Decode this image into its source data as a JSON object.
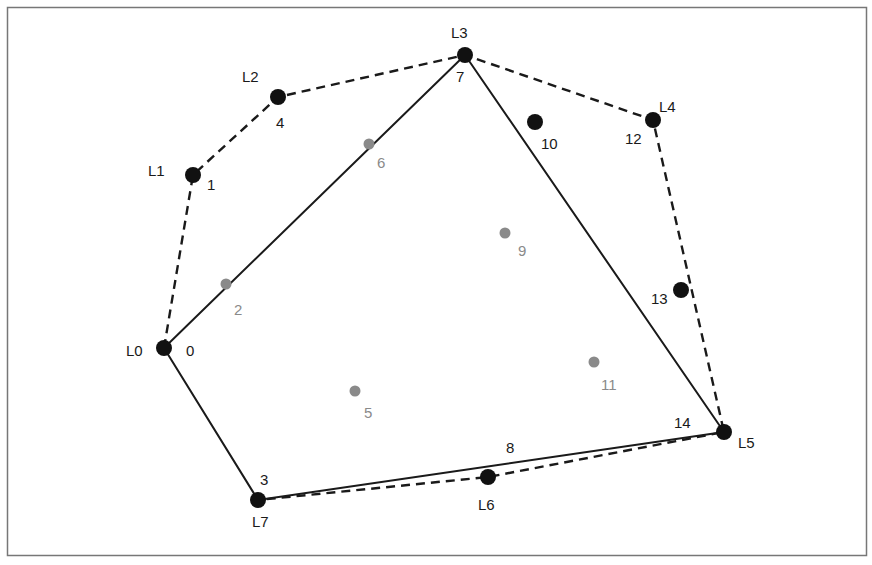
{
  "diagram": {
    "points": [
      {
        "id": "0",
        "x": 164,
        "y": 348,
        "style": "black",
        "hull_label": "L0",
        "id_pos": [
          186,
          356
        ],
        "hull_pos": [
          126,
          356
        ]
      },
      {
        "id": "1",
        "x": 193,
        "y": 175,
        "style": "black",
        "hull_label": "L1",
        "id_pos": [
          207,
          190
        ],
        "hull_pos": [
          148,
          176
        ]
      },
      {
        "id": "2",
        "x": 226,
        "y": 284,
        "style": "gray",
        "id_pos": [
          234,
          315
        ]
      },
      {
        "id": "3",
        "x": 258,
        "y": 500,
        "style": "black",
        "hull_label": "L7",
        "id_pos": [
          260,
          485
        ],
        "hull_pos": [
          252,
          527
        ]
      },
      {
        "id": "4",
        "x": 278,
        "y": 97,
        "style": "black",
        "hull_label": "L2",
        "id_pos": [
          276,
          128
        ],
        "hull_pos": [
          242,
          82
        ]
      },
      {
        "id": "5",
        "x": 355,
        "y": 391,
        "style": "gray",
        "id_pos": [
          364,
          418
        ]
      },
      {
        "id": "6",
        "x": 369,
        "y": 144,
        "style": "gray",
        "id_pos": [
          377,
          168
        ]
      },
      {
        "id": "7",
        "x": 465,
        "y": 55,
        "style": "black",
        "hull_label": "L3",
        "id_pos": [
          456,
          82
        ],
        "hull_pos": [
          451,
          38
        ]
      },
      {
        "id": "8",
        "x": 511,
        "y": 447,
        "style": "none",
        "id_pos": [
          506,
          453
        ]
      },
      {
        "id": "9",
        "x": 505,
        "y": 233,
        "style": "gray",
        "id_pos": [
          518,
          256
        ]
      },
      {
        "id": "10",
        "x": 535,
        "y": 122,
        "style": "black",
        "id_pos": [
          541,
          149
        ]
      },
      {
        "id": "11",
        "x": 594,
        "y": 362,
        "style": "gray",
        "id_pos": [
          601,
          390
        ]
      },
      {
        "id": "12",
        "x": 653,
        "y": 120,
        "style": "black",
        "hull_label": "L4",
        "id_pos": [
          625,
          144
        ],
        "hull_pos": [
          659,
          112
        ]
      },
      {
        "id": "13",
        "x": 681,
        "y": 290,
        "style": "black",
        "id_pos": [
          651,
          304
        ]
      },
      {
        "id": "14",
        "x": 724,
        "y": 432,
        "style": "black",
        "hull_label": "L5",
        "id_pos": [
          674,
          428
        ],
        "hull_pos": [
          738,
          448
        ]
      },
      {
        "id": "L6",
        "x": 488,
        "y": 477,
        "style": "black",
        "hull_label": "L6",
        "hull_pos": [
          478,
          510
        ]
      }
    ],
    "solid_hull": [
      "0",
      "7",
      "14",
      "3",
      "0"
    ],
    "dashed_hull": [
      "0",
      "1",
      "4",
      "7",
      "12",
      "14",
      "L6",
      "3"
    ],
    "colors": {
      "hull_point": "#111111",
      "interior_point": "#8a8a8a",
      "line": "#1a1a1a",
      "frame": "#777777"
    }
  }
}
